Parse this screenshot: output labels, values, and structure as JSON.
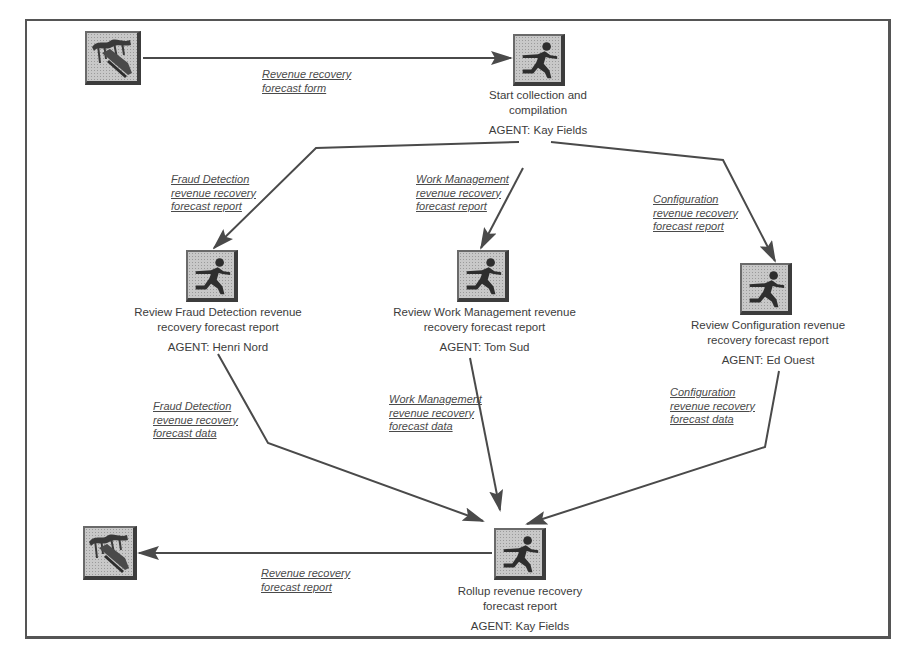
{
  "diagram": {
    "type": "workflow",
    "colors": {
      "line": "#4a4a4a",
      "frame": "#555555",
      "icon_bg": "#c8c8c8",
      "text": "#3c3c3c"
    },
    "nodes": {
      "source_doc": {
        "icon": "document-stack-icon"
      },
      "start": {
        "icon": "runner-icon",
        "title": "Start collection and compilation",
        "agent": "AGENT: Kay Fields"
      },
      "review_fraud": {
        "icon": "runner-icon",
        "title": "Review Fraud Detection revenue recovery forecast report",
        "agent": "AGENT: Henri Nord"
      },
      "review_work": {
        "icon": "runner-icon",
        "title": "Review Work Management revenue recovery forecast report",
        "agent": "AGENT: Tom Sud"
      },
      "review_config": {
        "icon": "runner-icon",
        "title": "Review Configuration revenue recovery forecast report",
        "agent": "AGENT: Ed Ouest"
      },
      "rollup": {
        "icon": "runner-icon",
        "title": "Rollup revenue recovery forecast report",
        "agent": "AGENT: Kay Fields"
      },
      "sink_doc": {
        "icon": "document-stack-icon"
      }
    },
    "edges": {
      "form": {
        "line1": "Revenue recovery",
        "line2": "forecast form"
      },
      "fraud_report": {
        "line1": "Fraud Detection",
        "line2": "revenue recovery",
        "line3": "forecast report"
      },
      "work_report": {
        "line1": "Work Management",
        "line2": "revenue recovery",
        "line3": "forecast report"
      },
      "config_report": {
        "line1": "Configuration",
        "line2": "revenue recovery",
        "line3": "forecast report"
      },
      "fraud_data": {
        "line1": "Fraud Detection",
        "line2": "revenue recovery",
        "line3": "forecast data"
      },
      "work_data": {
        "line1": "Work Management",
        "line2": "revenue recovery",
        "line3": "forecast data"
      },
      "config_data": {
        "line1": "Configuration",
        "line2": "revenue recovery",
        "line3": "forecast data"
      },
      "final_report": {
        "line1": "Revenue recovery",
        "line2": "forecast report"
      }
    }
  }
}
